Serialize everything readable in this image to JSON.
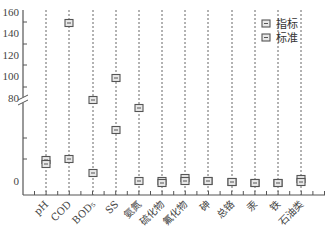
{
  "chart_data": {
    "type": "scatter",
    "title": "",
    "xlabel": "",
    "ylabel": "",
    "broken_axis": true,
    "y_upper_ticks": [
      "80",
      "100",
      "120",
      "140",
      "160"
    ],
    "y_lower_ticks": [
      "0"
    ],
    "categories": [
      "pH",
      "COD",
      "BOD5",
      "SS",
      "氨氮",
      "硫化物",
      "氟化物",
      "砷",
      "总铬",
      "汞",
      "铁",
      "石油类"
    ],
    "category_labels_display": [
      "pH",
      "COD",
      "BOD₅",
      "SS",
      "氨氮",
      "硫化物",
      "氟化物",
      "砷",
      "总铬",
      "汞",
      "铁",
      "石油类"
    ],
    "series": [
      {
        "name": "指标",
        "marker": "square-dash",
        "values": [
          7.5,
          8,
          2.5,
          20,
          0.5,
          0.2,
          0.8,
          0.02,
          0.02,
          0.001,
          0.1,
          0.3
        ]
      },
      {
        "name": "标准",
        "marker": "square-dash",
        "values": [
          7,
          150,
          78,
          98,
          70,
          0.5,
          1.5,
          0.1,
          0.5,
          0.01,
          0.3,
          1.0
        ]
      }
    ],
    "legend": {
      "position": "upper right",
      "entries": [
        "指标",
        "标准"
      ]
    },
    "grid": "vertical dashed lines per category"
  },
  "pixels": {
    "columns_x": [
      46,
      69,
      93,
      116,
      139,
      162,
      185,
      208,
      232,
      255,
      278,
      301
    ],
    "index_y": [
      164,
      159,
      173,
      130,
      181,
      183,
      181,
      181,
      182,
      183,
      183,
      182
    ],
    "standard_y": [
      160,
      23,
      100,
      78,
      108,
      181,
      178,
      181,
      182,
      183,
      183,
      179
    ]
  }
}
